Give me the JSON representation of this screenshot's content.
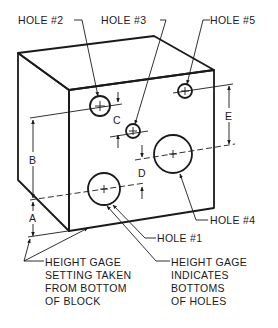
{
  "figure": {
    "type": "isometric-block-drawing",
    "colors": {
      "line": "#1a1a1a",
      "background": "#ffffff"
    }
  },
  "labels": {
    "hole2": "HOLE #2",
    "hole3": "HOLE #3",
    "hole5": "HOLE #5",
    "hole4": "HOLE #4",
    "hole1": "HOLE #1"
  },
  "dimensions": {
    "a": "A",
    "b": "B",
    "c": "C",
    "d": "D",
    "e": "E"
  },
  "notes": {
    "left": [
      "HEIGHT GAGE",
      "SETTING TAKEN",
      "FROM BOTTOM",
      "OF BLOCK"
    ],
    "right": [
      "HEIGHT GAGE",
      "INDICATES",
      "BOTTOMS",
      "OF HOLES"
    ]
  }
}
